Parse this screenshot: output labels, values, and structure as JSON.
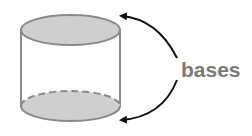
{
  "diagram": {
    "label": "bases",
    "parts": [
      {
        "name": "top base",
        "style": "solid outline, gray fill"
      },
      {
        "name": "bottom base",
        "style": "dashed back edge, gray fill"
      }
    ],
    "colors": {
      "base_fill": "#cfcfcf",
      "outline": "#8a8a8a",
      "arrow": "#111111",
      "label": "#7a7a7a",
      "background": "#ffffff"
    }
  }
}
